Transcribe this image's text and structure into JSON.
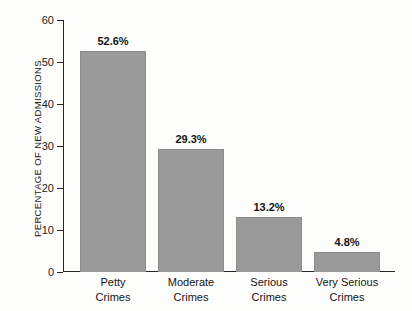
{
  "chart_data": {
    "type": "bar",
    "title": "",
    "subtitle": "",
    "xlabel": "",
    "ylabel": "PERCENTAGE OF NEW ADMISSIONS",
    "categories": [
      "Petty Crimes",
      "Moderate Crimes",
      "Serious Crimes",
      "Very Serious Crimes"
    ],
    "category_lines": [
      [
        "Petty",
        "Crimes"
      ],
      [
        "Moderate",
        "Crimes"
      ],
      [
        "Serious",
        "Crimes"
      ],
      [
        "Very Serious",
        "Crimes"
      ]
    ],
    "values": [
      52.6,
      29.3,
      13.2,
      4.8
    ],
    "data_labels": [
      "52.6%",
      "29.3%",
      "13.2%",
      "4.8%"
    ],
    "ylim": [
      0,
      60
    ],
    "yticks": [
      0,
      10,
      20,
      30,
      40,
      50,
      60
    ],
    "ytick_labels": [
      "0",
      "10",
      "20",
      "30",
      "40",
      "50",
      "60"
    ],
    "grid": false,
    "legend": false,
    "legend_position": "none",
    "bar_color": "#9a9a9a",
    "bar_edge_color": "#8d8d8d",
    "axis_color": "#262626",
    "background_color": "#fdfdfc",
    "text_color": "#1b1b1b"
  }
}
